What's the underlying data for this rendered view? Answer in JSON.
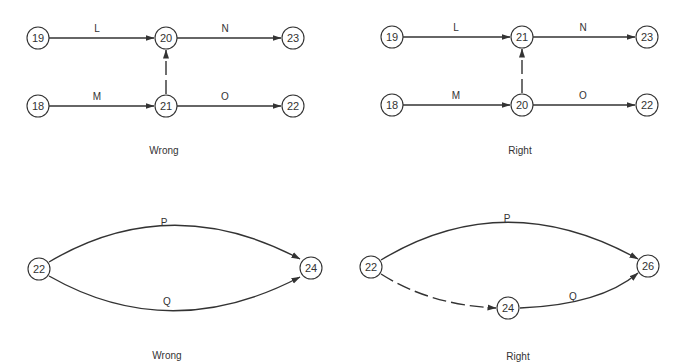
{
  "diagrams": [
    {
      "id": "top-wrong",
      "caption": "Wrong",
      "nodes": {
        "n19": "19",
        "n20": "20",
        "n23": "23",
        "n18": "18",
        "n21": "21",
        "n22": "22"
      },
      "edges": {
        "L": "L",
        "N": "N",
        "M": "M",
        "O": "O"
      },
      "dummy": {
        "from": "21",
        "to": "20",
        "style": "dashed"
      }
    },
    {
      "id": "top-right",
      "caption": "Right",
      "nodes": {
        "n19": "19",
        "n21": "21",
        "n23": "23",
        "n18": "18",
        "n20": "20",
        "n22": "22"
      },
      "edges": {
        "L": "L",
        "N": "N",
        "M": "M",
        "O": "O"
      },
      "dummy": {
        "from": "20",
        "to": "21",
        "style": "dashed"
      }
    },
    {
      "id": "bottom-wrong",
      "caption": "Wrong",
      "nodes": {
        "n22": "22",
        "n24": "24"
      },
      "edges": {
        "P": "P",
        "Q": "Q"
      }
    },
    {
      "id": "bottom-right",
      "caption": "Right",
      "nodes": {
        "n22": "22",
        "n24": "24",
        "n26": "26"
      },
      "edges": {
        "P": "P",
        "Q": "Q"
      },
      "dummy": {
        "from": "22",
        "to": "24",
        "style": "dashed"
      }
    }
  ]
}
